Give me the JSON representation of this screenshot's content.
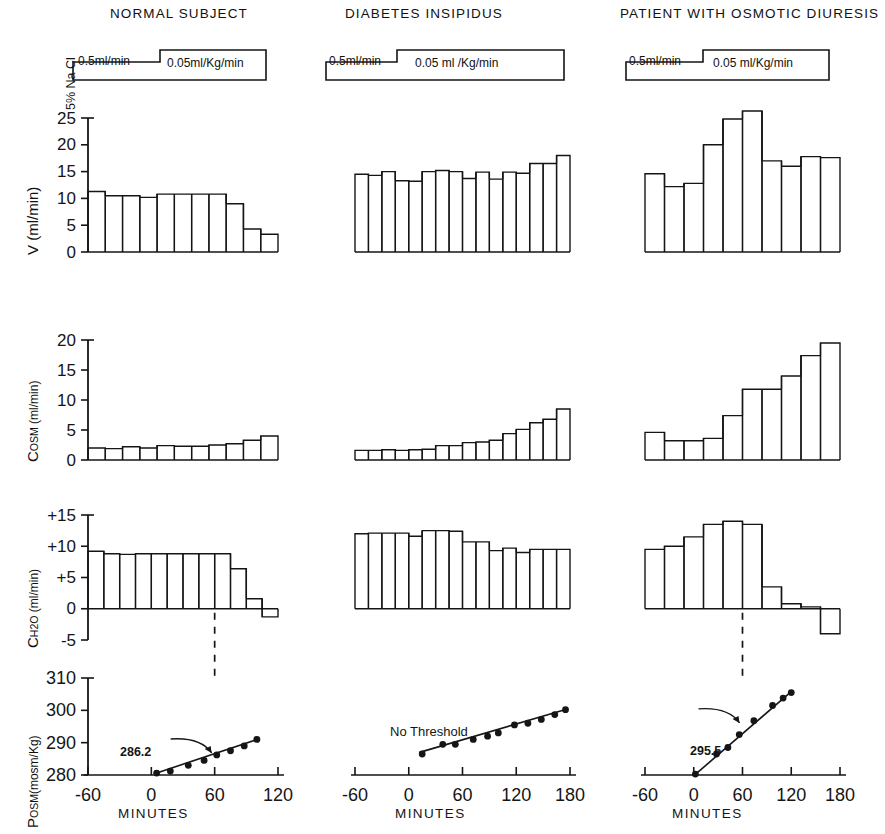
{
  "figure": {
    "columns": [
      {
        "id": "normal",
        "title": "NORMAL  SUBJECT"
      },
      {
        "id": "di",
        "title": "DIABETES   INSIPIDUS"
      },
      {
        "id": "osmotic",
        "title": "PATIENT WITH OSMOTIC DIURESIS"
      }
    ],
    "infusion": {
      "caption": "5% Na Cl",
      "phase1_label": "0.5ml/min",
      "phase2_label_normal": "0.05ml/Kg/min",
      "phase2_label_di": "0.05 ml /Kg/min",
      "phase2_label_osmotic": "0.05 ml/Kg/min"
    },
    "axis_labels": {
      "row1": "V (ml/min)",
      "row2_main": "C",
      "row2_sub": "OSM",
      "row2_unit": " (ml/min)",
      "row3_main": "C",
      "row3_sub": "H2O",
      "row3_unit": " (ml/min)",
      "row4_main": "P",
      "row4_sub": "OSM",
      "row4_unit": "(mosm/Kg)",
      "xaxis": "MINUTES"
    },
    "annotations": {
      "normal_threshold": "286.2",
      "di_threshold": "No Threshold",
      "osmotic_threshold": "295.5"
    }
  },
  "chart_data": [
    {
      "type": "bar",
      "panel": "V-normal",
      "title": "NORMAL  SUBJECT",
      "ylabel": "V (ml/min)",
      "xlabel": "MINUTES",
      "ylim": [
        0,
        25
      ],
      "yticks": [
        0,
        5,
        10,
        15,
        20,
        25
      ],
      "ytick_labels": [
        "0",
        "5",
        "10",
        "15",
        "20",
        "25"
      ],
      "xlim": [
        -60,
        120
      ],
      "xticks": [
        -60,
        0,
        60,
        120
      ],
      "xtick_labels": [
        "-60",
        "0",
        "60",
        "120"
      ],
      "bar_start": -32,
      "bar_width": 10,
      "values": [
        11.3,
        10.5,
        10.5,
        10.2,
        10.8,
        10.8,
        10.8,
        10.8,
        9.0,
        4.3,
        3.3
      ],
      "grid": false
    },
    {
      "type": "bar",
      "panel": "V-di",
      "title": "DIABETES   INSIPIDUS",
      "ylabel": "V (ml/min)",
      "xlabel": "MINUTES",
      "ylim": [
        0,
        25
      ],
      "xlim": [
        -60,
        180
      ],
      "xticks": [
        -60,
        0,
        60,
        120,
        180
      ],
      "xtick_labels": [
        "-60",
        "0",
        "60",
        "120",
        "180"
      ],
      "bar_start": -18,
      "bar_width": 11,
      "values": [
        14.5,
        14.3,
        15.0,
        13.3,
        13.2,
        15.0,
        15.2,
        15.0,
        13.7,
        14.9,
        13.6,
        14.9,
        14.7,
        16.5,
        16.5,
        18.0
      ],
      "grid": false
    },
    {
      "type": "bar",
      "panel": "V-osmotic",
      "title": "PATIENT WITH OSMOTIC DIURESIS",
      "ylabel": "V (ml/min)",
      "xlabel": "MINUTES",
      "ylim": [
        0,
        25
      ],
      "xlim": [
        -60,
        180
      ],
      "xticks": [
        -60,
        0,
        60,
        120,
        180
      ],
      "xtick_labels": [
        "-60",
        "0",
        "60",
        "120",
        "180"
      ],
      "bar_start": -22,
      "bar_width": 12,
      "values": [
        14.6,
        12.2,
        12.8,
        20.0,
        24.8,
        26.3,
        17.0,
        16.0,
        17.8,
        17.6
      ],
      "grid": false
    },
    {
      "type": "bar",
      "panel": "Cosm-normal",
      "ylabel": "COSM (ml/min)",
      "ylim": [
        0,
        20
      ],
      "yticks": [
        0,
        5,
        10,
        15,
        20
      ],
      "ytick_labels": [
        "0",
        "5",
        "10",
        "15",
        "20"
      ],
      "values": [
        2.0,
        1.9,
        2.2,
        2.0,
        2.4,
        2.3,
        2.3,
        2.5,
        2.7,
        3.3,
        4.0
      ],
      "grid": false
    },
    {
      "type": "bar",
      "panel": "Cosm-di",
      "ylabel": "COSM (ml/min)",
      "ylim": [
        0,
        20
      ],
      "values": [
        1.6,
        1.6,
        1.7,
        1.6,
        1.7,
        1.8,
        2.4,
        2.4,
        2.9,
        3.0,
        3.3,
        4.4,
        5.1,
        6.2,
        6.8,
        8.5
      ],
      "grid": false
    },
    {
      "type": "bar",
      "panel": "Cosm-osmotic",
      "ylabel": "COSM (ml/min)",
      "ylim": [
        0,
        20
      ],
      "values": [
        4.6,
        3.2,
        3.2,
        3.6,
        7.4,
        11.8,
        11.8,
        14.0,
        17.4,
        19.5
      ],
      "grid": false
    },
    {
      "type": "bar",
      "panel": "CH2O-normal",
      "ylabel": "CH2O (ml/min)",
      "ylim": [
        -5,
        15
      ],
      "yticks": [
        -5,
        0,
        5,
        10,
        15
      ],
      "ytick_labels": [
        "-5",
        "0",
        "+5",
        "+10",
        "+15"
      ],
      "values": [
        9.2,
        8.8,
        8.7,
        8.8,
        8.8,
        8.8,
        8.8,
        8.8,
        8.8,
        6.4,
        1.6,
        -1.3
      ],
      "grid": false
    },
    {
      "type": "bar",
      "panel": "CH2O-di",
      "ylabel": "CH2O (ml/min)",
      "ylim": [
        -5,
        15
      ],
      "values": [
        12.0,
        12.1,
        12.1,
        12.1,
        11.6,
        12.5,
        12.5,
        12.4,
        10.7,
        10.7,
        9.3,
        9.7,
        9.0,
        9.5,
        9.5,
        9.5
      ],
      "grid": false
    },
    {
      "type": "bar",
      "panel": "CH2O-osmotic",
      "ylabel": "CH2O (ml/min)",
      "ylim": [
        -5,
        15
      ],
      "values": [
        9.5,
        10.0,
        11.5,
        13.5,
        14.0,
        13.5,
        3.5,
        0.8,
        0.3,
        -4.0
      ],
      "grid": false
    },
    {
      "type": "scatter",
      "panel": "Posm-normal",
      "ylabel": "POSM (mosm/Kg)",
      "xlabel": "MINUTES",
      "ylim": [
        280,
        310
      ],
      "yticks": [
        280,
        290,
        300,
        310
      ],
      "ytick_labels": [
        "280",
        "290",
        "300",
        "310"
      ],
      "xlim": [
        -60,
        120
      ],
      "xticks": [
        -60,
        0,
        60,
        120
      ],
      "xtick_labels": [
        "-60",
        "0",
        "60",
        "120"
      ],
      "x": [
        5,
        18,
        35,
        50,
        62,
        75,
        88,
        100
      ],
      "y": [
        280.6,
        281.2,
        283.0,
        284.5,
        286.2,
        287.5,
        289.0,
        291.0
      ],
      "fit_line": {
        "x": [
          3,
          103
        ],
        "y": [
          280.4,
          291.3
        ]
      },
      "annotation": "286.2",
      "threshold_x": 60,
      "grid": false
    },
    {
      "type": "scatter",
      "panel": "Posm-di",
      "ylabel": "POSM (mosm/Kg)",
      "xlabel": "MINUTES",
      "ylim": [
        280,
        310
      ],
      "xlim": [
        -60,
        180
      ],
      "x": [
        15,
        38,
        52,
        72,
        88,
        100,
        118,
        133,
        148,
        163,
        175
      ],
      "y": [
        286.5,
        289.5,
        289.5,
        291.0,
        292.0,
        293.0,
        295.5,
        296.0,
        297.2,
        298.7,
        300.2
      ],
      "fit_line": {
        "x": [
          12,
          178
        ],
        "y": [
          287.0,
          300.5
        ]
      },
      "annotation": "No Threshold",
      "grid": false
    },
    {
      "type": "scatter",
      "panel": "Posm-osmotic",
      "ylabel": "POSM (mosm/Kg)",
      "xlabel": "MINUTES",
      "ylim": [
        280,
        310
      ],
      "xlim": [
        -60,
        180
      ],
      "x": [
        2,
        28,
        42,
        56,
        74,
        97,
        110,
        120
      ],
      "y": [
        280.3,
        286.5,
        288.5,
        292.5,
        296.8,
        301.5,
        303.8,
        305.5
      ],
      "fit_line": {
        "x": [
          2,
          121
        ],
        "y": [
          280.2,
          306.0
        ]
      },
      "annotation": "295.5",
      "threshold_x": 60,
      "grid": false
    }
  ]
}
